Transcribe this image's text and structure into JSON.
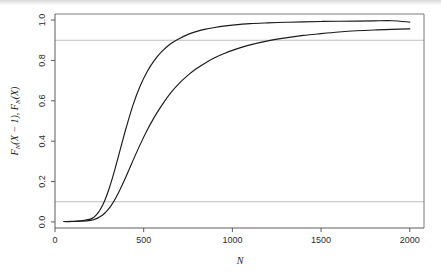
{
  "figure": {
    "background": "#ffffff",
    "curve_color": "#1a1a1a",
    "reference_line_color": "#b4b4b4",
    "axis_color": "#4a4a4a"
  },
  "axis": {
    "x_title": "N",
    "y_title_parts": {
      "f1": "F",
      "sub1": "N",
      "arg1": "(X − 1), ",
      "f2": "F",
      "sub2": "N",
      "arg2": "(X)"
    },
    "y_title_plain": "F_N(X − 1), F_N(X)"
  },
  "chart_data": {
    "type": "line",
    "title": "",
    "xlabel": "N",
    "ylabel": "F_N(X − 1), F_N(X)",
    "xlim": [
      0,
      2080
    ],
    "ylim": [
      -0.03,
      1.03
    ],
    "xticks": [
      0,
      500,
      1000,
      1500,
      2000
    ],
    "xticklabels": [
      "0",
      "500",
      "1000",
      "1500",
      "2000"
    ],
    "yticks": [
      0.0,
      0.2,
      0.4,
      0.6,
      0.8,
      1.0
    ],
    "yticklabels": [
      "0.0",
      "0.2",
      "0.4",
      "0.6",
      "0.8",
      "1.0"
    ],
    "grid": false,
    "legend": "none",
    "reference_lines": [
      {
        "orientation": "horizontal",
        "y": 0.1,
        "color": "#b4b4b4"
      },
      {
        "orientation": "horizontal",
        "y": 0.9,
        "color": "#b4b4b4"
      }
    ],
    "x": [
      50,
      100,
      150,
      200,
      220,
      240,
      260,
      280,
      300,
      320,
      340,
      360,
      380,
      400,
      440,
      480,
      520,
      560,
      600,
      650,
      700,
      750,
      800,
      850,
      900,
      950,
      1000,
      1100,
      1200,
      1300,
      1400,
      1500,
      1600,
      1700,
      1800,
      1900,
      2000
    ],
    "series": [
      {
        "name": "F_N(X − 1)",
        "values": [
          0.002,
          0.003,
          0.006,
          0.014,
          0.024,
          0.042,
          0.069,
          0.105,
          0.152,
          0.207,
          0.268,
          0.333,
          0.399,
          0.463,
          0.58,
          0.673,
          0.745,
          0.8,
          0.842,
          0.881,
          0.908,
          0.929,
          0.944,
          0.955,
          0.963,
          0.97,
          0.975,
          0.982,
          0.986,
          0.989,
          0.991,
          0.993,
          0.994,
          0.995,
          0.996,
          0.9965,
          0.99
        ]
      },
      {
        "name": "F_N(X)",
        "values": [
          0.002,
          0.002,
          0.004,
          0.008,
          0.012,
          0.019,
          0.029,
          0.043,
          0.062,
          0.086,
          0.115,
          0.148,
          0.185,
          0.224,
          0.305,
          0.383,
          0.455,
          0.519,
          0.575,
          0.637,
          0.686,
          0.727,
          0.761,
          0.789,
          0.813,
          0.833,
          0.85,
          0.877,
          0.897,
          0.912,
          0.924,
          0.933,
          0.941,
          0.947,
          0.951,
          0.954,
          0.956
        ]
      }
    ],
    "annotations": [
      {
        "text": "upper curve crosses 0.9 near N ≈ 665"
      },
      {
        "text": "lower curve crosses 0.9 near N ≈ 1320"
      }
    ]
  }
}
